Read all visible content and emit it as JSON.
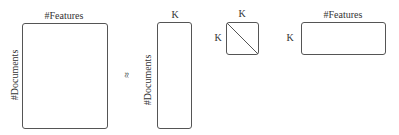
{
  "diagram": {
    "matrices": [
      {
        "id": "document_feature_matrix",
        "top_label": "#Features",
        "side_label": "#Documents"
      },
      {
        "id": "document_topic_matrix",
        "top_label": "K",
        "side_label": "#Documents"
      },
      {
        "id": "diagonal_matrix",
        "top_label": "K",
        "side_label": "K"
      },
      {
        "id": "topic_feature_matrix",
        "top_label": "#Features",
        "side_label": "K"
      }
    ],
    "operator": "≈"
  }
}
